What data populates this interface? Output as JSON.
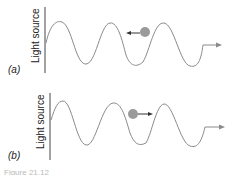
{
  "figure": {
    "panels": [
      {
        "tag": "(a)",
        "axis_label": "Light source",
        "particle_direction": "left",
        "colors": {
          "wave": "#8a8a8a",
          "particle": "#9a9a9a",
          "arrow": "#333333",
          "axis": "#444444"
        }
      },
      {
        "tag": "(b)",
        "axis_label": "Light source",
        "particle_direction": "right",
        "colors": {
          "wave": "#8a8a8a",
          "particle": "#9a9a9a",
          "arrow": "#333333",
          "axis": "#444444"
        }
      }
    ],
    "caption_partial": "Figure 21.12"
  }
}
